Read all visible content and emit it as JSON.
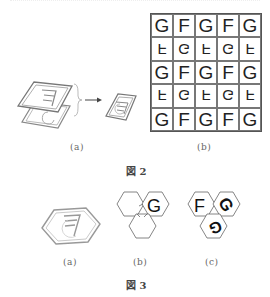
{
  "figure2": {
    "label": "図 2",
    "panel_a": {
      "caption": "(a)",
      "description": "two stacked tiles (F tile over G tile) combined into one tile"
    },
    "panel_b": {
      "caption": "(b)",
      "grid": [
        [
          "G",
          "F",
          "G",
          "F",
          "G"
        ],
        [
          "F",
          "G",
          "F",
          "G",
          "F"
        ],
        [
          "G",
          "F",
          "G",
          "F",
          "G"
        ],
        [
          "F",
          "G",
          "F",
          "G",
          "F"
        ],
        [
          "G",
          "F",
          "G",
          "F",
          "G"
        ]
      ],
      "flipped_rows": [
        1,
        3
      ]
    }
  },
  "figure3": {
    "label": "図 3",
    "panel_a": {
      "caption": "(a)",
      "description": "hexagonal tile with F over G"
    },
    "panel_b": {
      "caption": "(b)",
      "letter": "G"
    },
    "panel_c": {
      "caption": "(c)",
      "letters": [
        "F",
        "G",
        "G"
      ]
    }
  },
  "colors": {
    "line": "#555555",
    "light_line": "#999999",
    "text": "#222222"
  }
}
